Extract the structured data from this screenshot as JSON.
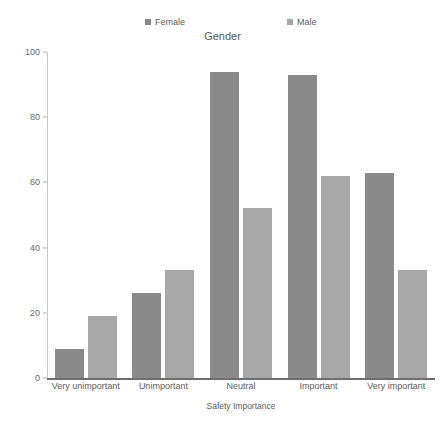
{
  "chart_data": {
    "type": "bar",
    "title": "Gender",
    "xlabel": "Safety Importance",
    "ylabel": "",
    "categories": [
      "Very unimportant",
      "Unimportant",
      "Neutral",
      "Important",
      "Very important"
    ],
    "series": [
      {
        "name": "Female",
        "color": "#8a8a8a",
        "values": [
          9,
          26,
          94,
          93,
          63
        ]
      },
      {
        "name": "Male",
        "color": "#a8a8a8",
        "values": [
          19,
          33,
          52,
          62,
          33
        ]
      }
    ],
    "ylim": [
      0,
      100
    ],
    "yticks": [
      0,
      20,
      40,
      60,
      80,
      100
    ],
    "grid": false,
    "legend_position": "top",
    "legend_title": "Gender",
    "legend_marker": "square"
  },
  "legend": {
    "entries": [
      {
        "label": "Female",
        "marker": "legend-swatch-female"
      },
      {
        "label": "Male",
        "marker": "legend-swatch-male"
      }
    ]
  },
  "axis": {
    "y": {
      "ticks": [
        "100",
        "80",
        "60",
        "40",
        "20",
        "0"
      ]
    },
    "x": {
      "title": "Safety Importance"
    }
  }
}
